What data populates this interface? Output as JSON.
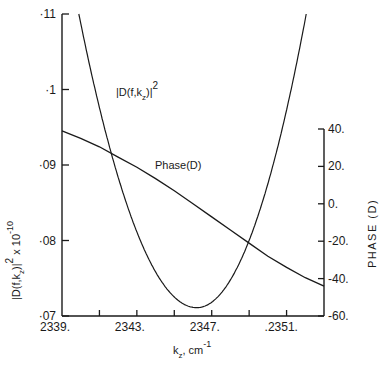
{
  "chart_data": {
    "type": "line",
    "title": "",
    "xlabel": "k_z, cm^-1",
    "ylabel": "|D(f,k_z)|^2 x 10^-10",
    "y2label": "PHASE (D)",
    "xlim": [
      2339,
      2353
    ],
    "ylim": [
      0.07,
      0.11
    ],
    "y2lim": [
      -60,
      40
    ],
    "x_ticks": [
      2339,
      2341,
      2343,
      2345,
      2347,
      2349,
      2351
    ],
    "x_tick_labels": [
      "2339.",
      "",
      "2343.",
      "",
      "2347.",
      "",
      ".2351."
    ],
    "y_ticks": [
      0.07,
      0.08,
      0.09,
      0.1,
      0.11
    ],
    "y_tick_labels": [
      "·07",
      "·08",
      "·09",
      "·1",
      "·11"
    ],
    "y2_ticks": [
      -60,
      -40,
      -20,
      0,
      20,
      40
    ],
    "y2_tick_labels": [
      "-60.",
      "-40.",
      "-20.",
      "0.",
      "20.",
      "40."
    ],
    "grid": false,
    "legend": "none (inline labels)",
    "annotations": [
      {
        "text": "|D(f,k_z)|^2",
        "near": "left branch of parabola"
      },
      {
        "text": "Phase(D)",
        "near": "descending phase line"
      }
    ],
    "series": [
      {
        "name": "|D(f,k_z)|^2",
        "axis": "left",
        "x": [
          2339.9,
          2341.0,
          2342.0,
          2343.0,
          2344.0,
          2345.0,
          2346.0,
          2346.2,
          2347.0,
          2348.0,
          2349.0,
          2350.0,
          2351.0,
          2352.05
        ],
        "values": [
          0.11,
          0.0985,
          0.0895,
          0.0825,
          0.077,
          0.0732,
          0.0712,
          0.0711,
          0.0718,
          0.075,
          0.0805,
          0.088,
          0.0975,
          0.11
        ]
      },
      {
        "name": "Phase(D)",
        "axis": "right",
        "x": [
          2339.0,
          2340.0,
          2341.0,
          2342.0,
          2343.0,
          2344.0,
          2345.0,
          2346.0,
          2347.0,
          2348.0,
          2349.0,
          2350.0,
          2351.0,
          2352.0,
          2353.0
        ],
        "values": [
          39,
          35,
          30.5,
          25,
          19.5,
          13.5,
          7,
          0,
          -7,
          -14,
          -21,
          -28,
          -34,
          -39.5,
          -44
        ]
      }
    ]
  },
  "labels": {
    "curve1": "|D(f,k",
    "curve1_sub": "z",
    "curve1_end": ")|",
    "curve1_sup": "2",
    "curve2": "Phase(D)",
    "xlabel_main": "k",
    "xlabel_sub": "z",
    "xlabel_unit": ", cm",
    "xlabel_sup": "-1",
    "ylabel_text": "|D(f",
    "ylabel_rest": ",k",
    "ylabel_sub": "z",
    "ylabel_end": ")|",
    "ylabel_sq": "2",
    "ylabel_times": " x 10",
    "ylabel_exp": "-10",
    "y2label": "PHASE (D)"
  }
}
